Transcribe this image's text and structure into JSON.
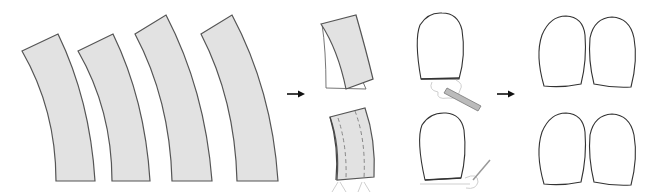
{
  "diagram": {
    "colors": {
      "fabric_fill": "#e2e2e2",
      "fabric_stroke": "#555555",
      "outline": "#333333",
      "arrow": "#111111",
      "background": "#ffffff"
    },
    "stages": [
      {
        "id": "stage-1",
        "label": "",
        "content": "four curved fabric strips",
        "count": 4
      },
      {
        "id": "stage-2",
        "label": "",
        "content": "strip folded in half (top) and stitched along both sides with dashed seam lines (bottom)"
      },
      {
        "id": "stage-3",
        "label": "",
        "content": "rounded pouch being trimmed/pressed at the open edge with a tool (top and bottom)"
      },
      {
        "id": "stage-4",
        "label": "",
        "content": "two pairs of finished rounded pouches",
        "count": 4
      }
    ],
    "arrows": [
      {
        "id": "arrow-1",
        "direction": "right",
        "from": "stage-1",
        "to": "stage-2"
      },
      {
        "id": "arrow-2",
        "direction": "right",
        "from": "stage-3",
        "to": "stage-4"
      }
    ]
  }
}
